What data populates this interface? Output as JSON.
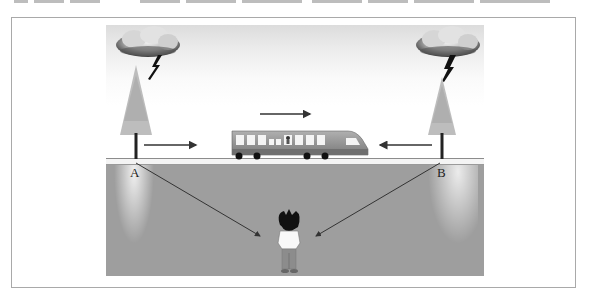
{
  "figure": {
    "labels": {
      "point_a": "A",
      "point_b": "B"
    },
    "elements": {
      "left_cloud": "storm-cloud",
      "right_cloud": "storm-cloud",
      "left_bolt": "lightning-bolt",
      "right_bolt": "lightning-bolt",
      "left_tree": "pine-tree",
      "right_tree": "pine-tree",
      "train": "train",
      "observer": "boy-observer"
    },
    "arrows": {
      "train_motion": "right",
      "from_a": "right",
      "from_b": "left",
      "a_to_observer": "diagonal-down-right",
      "b_to_observer": "diagonal-down-left"
    },
    "colors": {
      "ground": "#9e9e9e",
      "train_body": "#8a8a8a",
      "arrow": "#333333"
    }
  }
}
